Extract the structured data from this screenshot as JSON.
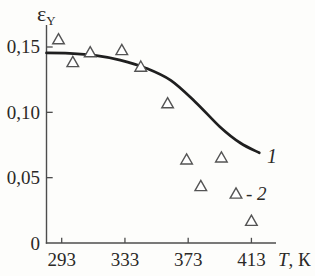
{
  "figure": {
    "background": "#fdfdfb",
    "y_axis_symbol": "ε",
    "y_axis_symbol_sub": "Y",
    "x_axis_var": "T",
    "x_axis_unit": ", К",
    "curve_label": "1",
    "legend_label": "- 2",
    "colors": {
      "curve": "#1f1f1f",
      "axis": "#4d4d4d",
      "marker_stroke": "#545454",
      "marker_fill": "#ffffff",
      "text": "#2b2927"
    }
  },
  "chart_data": {
    "type": "scatter",
    "title": "",
    "xlabel": "T, К",
    "ylabel": "ε_Y",
    "xlim": [
      283,
      429
    ],
    "ylim": [
      0,
      0.167
    ],
    "grid": false,
    "legend_position": "inline-right",
    "x_ticks": [
      {
        "value": 293,
        "label": "293"
      },
      {
        "value": 333,
        "label": "333"
      },
      {
        "value": 373,
        "label": "373"
      },
      {
        "value": 413,
        "label": "413"
      }
    ],
    "y_ticks": [
      {
        "value": 0,
        "label": "0"
      },
      {
        "value": 0.05,
        "label": "0,05"
      },
      {
        "value": 0.1,
        "label": "0,10"
      },
      {
        "value": 0.15,
        "label": "0,15"
      }
    ],
    "series": [
      {
        "name": "1",
        "type": "line",
        "style": "smooth-curve",
        "points": [
          [
            283.4,
            0.1455
          ],
          [
            298,
            0.1452
          ],
          [
            314,
            0.1436
          ],
          [
            330,
            0.14
          ],
          [
            346,
            0.134
          ],
          [
            362,
            0.1245
          ],
          [
            377.5,
            0.108
          ],
          [
            393,
            0.089
          ],
          [
            406,
            0.0765
          ],
          [
            418,
            0.069
          ]
        ]
      },
      {
        "name": "2",
        "type": "scatter",
        "marker": "open-triangle",
        "points": [
          [
            291,
            0.156
          ],
          [
            300,
            0.1385
          ],
          [
            311,
            0.146
          ],
          [
            331,
            0.1477
          ],
          [
            343,
            0.135
          ],
          [
            360,
            0.107
          ],
          [
            372,
            0.064
          ],
          [
            381,
            0.0436
          ],
          [
            394,
            0.0655
          ],
          [
            413,
            0.017
          ]
        ]
      }
    ],
    "annotations": [
      {
        "text": "1",
        "meaning": "label of fitted curve (series 1)"
      },
      {
        "text": "- 2",
        "meaning": "legend for triangle markers (series 2)"
      }
    ]
  }
}
